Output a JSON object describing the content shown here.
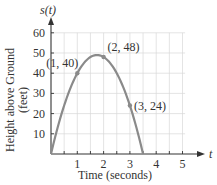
{
  "chart_data": {
    "type": "line",
    "title": "",
    "function": "s(t) = -16t^2 + 56t",
    "xlabel": "Time (seconds)",
    "ylabel_line1": "Height above Ground",
    "ylabel_line2": "(feet)",
    "x_axis_symbol": "t",
    "y_axis_symbol": "s(t)",
    "xlim": [
      0,
      5
    ],
    "ylim": [
      0,
      60
    ],
    "x_ticks": [
      1,
      2,
      3,
      4,
      5
    ],
    "y_ticks": [
      10,
      20,
      30,
      40,
      50,
      60
    ],
    "grid": true,
    "series": [
      {
        "name": "s(t)",
        "x": [
          0,
          0.5,
          1,
          1.5,
          1.75,
          2,
          2.5,
          3,
          3.5
        ],
        "values": [
          0,
          24,
          40,
          48,
          49,
          48,
          40,
          24,
          0
        ]
      }
    ],
    "annotations": [
      {
        "x": 1,
        "y": 40,
        "label": "(1, 40)"
      },
      {
        "x": 2,
        "y": 48,
        "label": "(2, 48)"
      },
      {
        "x": 3,
        "y": 24,
        "label": "(3, 24)"
      }
    ],
    "colors": {
      "curve": "#8a8a8a",
      "axis": "#333333",
      "grid": "#d9d9d9"
    }
  }
}
